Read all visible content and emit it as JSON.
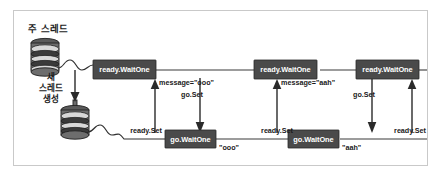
{
  "figure": {
    "frame": {
      "border_color": "#c9c9c9",
      "background": "#ffffff"
    }
  },
  "labels": {
    "main_thread": "주 스레드",
    "new_thread_line1": "새",
    "new_thread_line2": "스레드",
    "new_thread_line3": "생성"
  },
  "top_lane": {
    "boxes": [
      {
        "label": "ready.WaitOne"
      },
      {
        "label": "ready.WaitOne"
      },
      {
        "label": "ready.WaitOne"
      }
    ],
    "annotations": [
      {
        "text": "message=\"ooo\""
      },
      {
        "text": "go.Set"
      },
      {
        "text": "message=\"aah\""
      },
      {
        "text": "go.Set"
      }
    ]
  },
  "bottom_lane": {
    "boxes": [
      {
        "label": "go.WaitOne"
      },
      {
        "label": "go.WaitOne"
      }
    ],
    "annotations": [
      {
        "text": "ready.Set"
      },
      {
        "text": "\"ooo\""
      },
      {
        "text": "ready.Set"
      },
      {
        "text": "\"aah\""
      },
      {
        "text": "ready.Set"
      }
    ]
  },
  "colors": {
    "box_fill": "#4a4a4a",
    "box_text": "#ffffff",
    "line": "#2a2a2a",
    "frame": "#c9c9c9"
  }
}
